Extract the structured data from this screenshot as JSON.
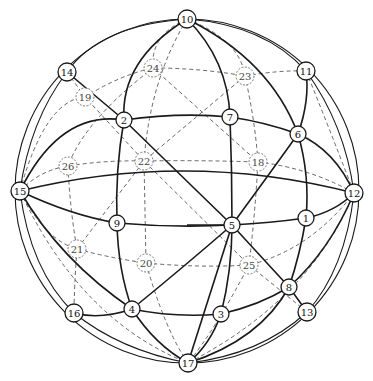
{
  "diagram": {
    "type": "sphere-graph",
    "sphere": {
      "cx": 187,
      "cy": 191,
      "r": 172
    },
    "nodes": [
      {
        "id": "1",
        "x": 306,
        "y": 218,
        "visible": true
      },
      {
        "id": "2",
        "x": 124,
        "y": 120,
        "visible": true
      },
      {
        "id": "3",
        "x": 221,
        "y": 314,
        "visible": true
      },
      {
        "id": "4",
        "x": 132,
        "y": 309,
        "visible": true
      },
      {
        "id": "5",
        "x": 232,
        "y": 225,
        "visible": true
      },
      {
        "id": "6",
        "x": 298,
        "y": 134,
        "visible": true
      },
      {
        "id": "7",
        "x": 230,
        "y": 117,
        "visible": true
      },
      {
        "id": "8",
        "x": 289,
        "y": 287,
        "visible": true
      },
      {
        "id": "9",
        "x": 117,
        "y": 223,
        "visible": true
      },
      {
        "id": "10",
        "x": 187,
        "y": 19,
        "visible": true
      },
      {
        "id": "11",
        "x": 306,
        "y": 71,
        "visible": true
      },
      {
        "id": "12",
        "x": 354,
        "y": 193,
        "visible": true
      },
      {
        "id": "13",
        "x": 307,
        "y": 312,
        "visible": true
      },
      {
        "id": "14",
        "x": 67,
        "y": 72,
        "visible": true
      },
      {
        "id": "15",
        "x": 20,
        "y": 191,
        "visible": true
      },
      {
        "id": "16",
        "x": 74,
        "y": 313,
        "visible": true
      },
      {
        "id": "17",
        "x": 188,
        "y": 363,
        "visible": true
      },
      {
        "id": "18",
        "x": 258,
        "y": 162,
        "visible": false
      },
      {
        "id": "19",
        "x": 85,
        "y": 97,
        "visible": false
      },
      {
        "id": "20",
        "x": 146,
        "y": 263,
        "visible": false
      },
      {
        "id": "21",
        "x": 77,
        "y": 249,
        "visible": false
      },
      {
        "id": "22",
        "x": 144,
        "y": 161,
        "visible": false
      },
      {
        "id": "23",
        "x": 245,
        "y": 76,
        "visible": false
      },
      {
        "id": "24",
        "x": 153,
        "y": 68,
        "visible": false
      },
      {
        "id": "25",
        "x": 249,
        "y": 265,
        "visible": false
      },
      {
        "id": "26",
        "x": 68,
        "y": 166,
        "visible": false
      }
    ],
    "solid_paths": [
      "M20,191 Q187,150 354,193",
      "M20,191 Q60,110 124,120 Q180,112 230,117 Q265,122 298,134 Q335,150 354,193",
      "M20,191 Q70,215 117,223 Q175,228 232,225 Q270,223 306,218 Q335,212 354,193",
      "M187,19 Q120,60 124,120 Q115,170 117,223 Q118,270 132,309 Q155,345 188,363",
      "M187,19 Q228,60 230,117 Q232,170 232,225 Q232,270 221,314 Q210,345 188,363",
      "M187,19 Q270,60 298,134 Q310,175 306,218 Q300,255 289,287 Q260,340 188,363",
      "M67,72 L124,120 L232,225 L289,287 L307,312",
      "M306,71 Q310,100 298,134 Q265,180 232,225 Q180,270 132,309 Q100,320 74,313",
      "M20,191 Q60,260 132,309 Q175,318 221,314 Q260,305 289,287 Q330,250 354,193",
      "M187,225 L232,225",
      "M232,225 L188,363"
    ],
    "thin_paths": [
      "M187,19 Q100,25 67,72 Q30,120 20,191",
      "M187,19 Q265,25 306,71 Q345,125 354,193",
      "M20,191 Q30,270 74,313 Q120,350 188,363",
      "M354,193 Q345,270 307,312 Q260,355 188,363"
    ],
    "dashed_paths": [
      "M20,191 Q40,170 68,166 Q105,160 144,161 Q200,160 258,162 Q310,168 354,193",
      "M20,191 Q45,240 77,249 Q110,258 146,263 Q200,268 249,265 Q310,250 354,193",
      "M20,191 Q45,100 85,97 Q120,75 153,68 Q200,68 245,76 Q280,70 306,71",
      "M187,19 Q150,35 153,68 Q85,120 68,166 Q70,210 77,249 Q74,290 74,313",
      "M187,19 Q150,80 144,161 Q145,210 146,263 Q165,330 188,363",
      "M187,19 Q240,40 245,76 Q255,120 258,162 Q255,215 249,265 Q215,330 188,363",
      "M67,72 L85,97 L144,161 L249,265 L307,312",
      "M245,76 L144,161 L77,249",
      "M153,68 L258,162",
      "M306,71 Q330,130 354,193",
      "M20,191 Q80,320 188,363",
      "M354,193 Q310,300 188,363"
    ]
  }
}
